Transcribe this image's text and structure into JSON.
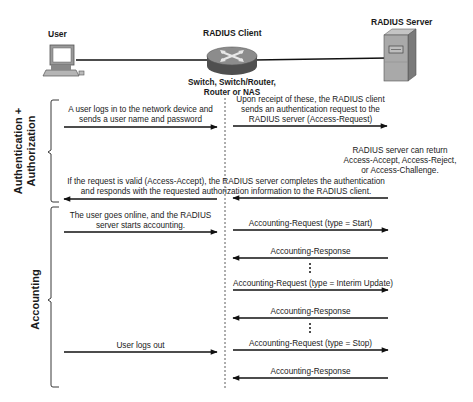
{
  "nodes": {
    "user": {
      "label": "User",
      "icon": "laptop-icon"
    },
    "client": {
      "label": "RADIUS Client",
      "icon": "router-icon",
      "sublabel_line1": "Switch, Switch/Router,",
      "sublabel_line2": "Router or NAS"
    },
    "server": {
      "label": "RADIUS Server",
      "icon": "server-icon"
    }
  },
  "phases": {
    "auth": {
      "label_line1": "Authentication +",
      "label_line2": "Authorization"
    },
    "accounting": {
      "label": "Accounting"
    }
  },
  "messages": {
    "login": {
      "line1": "A user logs in to the network device and",
      "line2": "sends a user name and password",
      "direction": "right"
    },
    "access_request": {
      "line1": "Upon receipt of these, the RADIUS client",
      "line2": "sends an authentication request to the",
      "line3": "RADIUS server (Access-Request)",
      "direction": "right"
    },
    "server_note": {
      "line1": "RADIUS server can return",
      "line2": "Access-Accept, Access-Reject,",
      "line3": "or Access-Challenge."
    },
    "access_accept": {
      "line1": "If the request is valid (Access-Accept), the RADIUS server completes the authentication",
      "line2": "and responds with the requested authorization information to the RADIUS client.",
      "direction": "left"
    },
    "online": {
      "line1": "The user goes online, and the RADIUS",
      "line2": "server starts accounting.",
      "direction": "right"
    },
    "acct_start": {
      "label": "Accounting-Request (type = Start)",
      "direction": "right"
    },
    "acct_resp1": {
      "label": "Accounting-Response",
      "direction": "left"
    },
    "acct_interim": {
      "label": "Accounting-Request (type = Interim Update)",
      "direction": "right"
    },
    "acct_resp2": {
      "label": "Accounting-Response",
      "direction": "left"
    },
    "logout": {
      "label": "User logs out",
      "direction": "right"
    },
    "acct_stop": {
      "label": "Accounting-Request (type = Stop)",
      "direction": "right"
    },
    "acct_resp3": {
      "label": "Accounting-Response",
      "direction": "left"
    }
  },
  "colors": {
    "line": "#111111",
    "router_body": "#5a5a5a",
    "router_top": "#8a8a8a",
    "server_front": "#a8a8a8",
    "server_side": "#7c7c7c"
  }
}
